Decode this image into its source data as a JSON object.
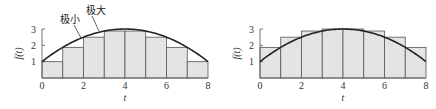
{
  "chart_data": [
    {
      "type": "bar",
      "title": "",
      "xlabel": "t",
      "ylabel": "f(t)",
      "xlim": [
        0,
        8
      ],
      "ylim": [
        0,
        3
      ],
      "x_ticks": [
        0,
        2,
        4,
        6,
        8
      ],
      "y_ticks": [
        1,
        2,
        3
      ],
      "grid": false,
      "curve": {
        "name": "f(t)",
        "x": [
          0,
          1,
          2,
          3,
          4,
          5,
          6,
          7,
          8
        ],
        "y": [
          1,
          1.875,
          2.5,
          2.875,
          3,
          2.875,
          2.5,
          1.875,
          1
        ]
      },
      "bars": {
        "name": "lower rectangles",
        "left_edges": [
          0,
          1,
          2,
          3,
          4,
          5,
          6,
          7
        ],
        "width": 1,
        "values": [
          1,
          1.875,
          2.5,
          2.875,
          2.875,
          2.5,
          1.875,
          1
        ]
      },
      "annotations": [
        {
          "text": "极小",
          "x": 60,
          "y": 23,
          "target": [
            81,
            38
          ]
        },
        {
          "text": "极大",
          "x": 86,
          "y": 14,
          "target": [
            99,
            31
          ]
        }
      ],
      "frame": {
        "left": 42,
        "right": 208,
        "top": 29,
        "bottom": 78
      }
    },
    {
      "type": "bar",
      "title": "",
      "xlabel": "t",
      "ylabel": "f(t)",
      "xlim": [
        0,
        8
      ],
      "ylim": [
        0,
        3
      ],
      "x_ticks": [
        0,
        2,
        4,
        6,
        8
      ],
      "y_ticks": [
        1,
        2,
        3
      ],
      "grid": false,
      "curve": {
        "name": "f(t)",
        "x": [
          0,
          1,
          2,
          3,
          4,
          5,
          6,
          7,
          8
        ],
        "y": [
          1,
          1.875,
          2.5,
          2.875,
          3,
          2.875,
          2.5,
          1.875,
          1
        ]
      },
      "bars": {
        "name": "upper rectangles",
        "left_edges": [
          0,
          1,
          2,
          3,
          4,
          5,
          6,
          7
        ],
        "width": 1,
        "values": [
          1.875,
          2.5,
          2.875,
          3,
          3,
          2.875,
          2.5,
          1.875
        ]
      },
      "annotations": [],
      "frame": {
        "left": 260,
        "right": 426,
        "top": 29,
        "bottom": 78
      }
    }
  ],
  "colors": {
    "bar_fill": "#e4e4e4",
    "bar_stroke": "#555555",
    "curve": "#222222",
    "axis": "#555555",
    "text": "#333333"
  }
}
